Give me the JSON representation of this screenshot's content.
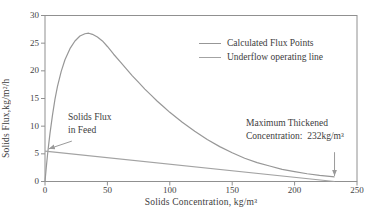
{
  "chart_data": {
    "type": "line",
    "title": "",
    "xlabel": "Solids Concentration, kg/m³",
    "ylabel": "Solids Flux,kg/m²/h",
    "xlim": [
      0,
      250
    ],
    "ylim": [
      0,
      30
    ],
    "x_ticks": [
      "0",
      "50",
      "100",
      "150",
      "200",
      "250"
    ],
    "y_ticks": [
      "0",
      "5",
      "10",
      "15",
      "20",
      "25",
      "30"
    ],
    "grid": false,
    "legend_position": "upper-right",
    "frame_color": "#909090",
    "arrow_color": "#9a9a9a",
    "series": [
      {
        "name": "Calculated Flux Points",
        "color": "#979797",
        "points": [
          [
            0,
            0
          ],
          [
            1,
            2.5
          ],
          [
            2,
            4.8
          ],
          [
            3,
            6.8
          ],
          [
            4,
            8.7
          ],
          [
            6,
            12
          ],
          [
            8,
            14.9
          ],
          [
            10,
            17.2
          ],
          [
            13,
            19.9
          ],
          [
            16,
            22
          ],
          [
            20,
            24
          ],
          [
            24,
            25.4
          ],
          [
            28,
            26.3
          ],
          [
            32,
            26.7
          ],
          [
            35,
            26.8
          ],
          [
            38,
            26.6
          ],
          [
            42,
            26.1
          ],
          [
            46,
            25.4
          ],
          [
            50,
            24.4
          ],
          [
            55,
            23
          ],
          [
            60,
            21.7
          ],
          [
            65,
            20.4
          ],
          [
            70,
            19.1
          ],
          [
            75,
            17.9
          ],
          [
            80,
            16.7
          ],
          [
            85,
            15.6
          ],
          [
            90,
            14.5
          ],
          [
            95,
            13.5
          ],
          [
            100,
            12.5
          ],
          [
            110,
            10.7
          ],
          [
            120,
            9.1
          ],
          [
            130,
            7.6
          ],
          [
            140,
            6.3
          ],
          [
            150,
            5.2
          ],
          [
            160,
            4.2
          ],
          [
            170,
            3.4
          ],
          [
            180,
            2.8
          ],
          [
            190,
            2.2
          ],
          [
            200,
            1.8
          ],
          [
            210,
            1.4
          ],
          [
            220,
            1.1
          ],
          [
            232,
            0.85
          ]
        ]
      },
      {
        "name": "Underflow operating line",
        "color": "#a3a3a3",
        "points": [
          [
            0,
            5.5
          ],
          [
            232,
            0
          ]
        ]
      }
    ],
    "annotations": [
      {
        "lines": [
          "Solids Flux",
          "in Feed"
        ],
        "arrow": {
          "from": [
            21.5,
            7.3
          ],
          "to": [
            3,
            5.9
          ]
        }
      },
      {
        "lines": [
          "Maximum Thickened",
          "Concentration:  232kg/m³"
        ],
        "value": 232,
        "arrow": {
          "from": [
            232,
            5.3
          ],
          "to": [
            232,
            1.0
          ]
        }
      }
    ]
  }
}
